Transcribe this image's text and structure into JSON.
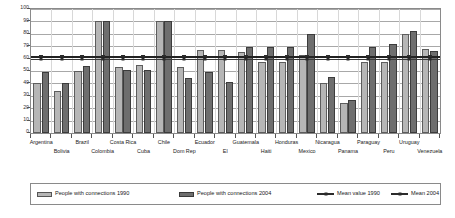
{
  "chart_data": {
    "type": "bar",
    "title": "",
    "xlabel": "",
    "ylabel": "",
    "ylim": [
      0,
      100
    ],
    "ytick_labels": [
      "100",
      "90",
      "80",
      "70",
      "60",
      "50",
      "40",
      "30",
      "20",
      "10",
      "0"
    ],
    "ytick_values": [
      100,
      90,
      80,
      70,
      60,
      50,
      40,
      30,
      20,
      10,
      0
    ],
    "grid": true,
    "legend_position": "bottom",
    "categories": [
      "Argentina",
      "Bolivia",
      "Brazil",
      "Colombia",
      "Costa Rica",
      "Cuba",
      "Chile",
      "Dom Rep",
      "Ecuador",
      "El",
      "Guatemala",
      "Haiti",
      "Honduras",
      "Mexico",
      "Nicaragua",
      "Panama",
      "Paraguay",
      "Peru",
      "Uruguay",
      "Venezuela"
    ],
    "series": [
      {
        "name": "People with connections 1990",
        "color": "#b6b6b6",
        "values": [
          40,
          34,
          50,
          90,
          53,
          55,
          90,
          53,
          67,
          67,
          65,
          57,
          57,
          63,
          40,
          24,
          57,
          57,
          80,
          68
        ]
      },
      {
        "name": "People with connections 2004",
        "color": "#6e6e6e",
        "values": [
          49,
          40,
          54,
          90,
          51,
          51,
          90,
          44,
          49,
          41,
          69,
          69,
          69,
          80,
          45,
          27,
          69,
          72,
          82,
          66
        ]
      }
    ],
    "reference_lines": [
      {
        "name": "Mean value 1990",
        "value": 60,
        "style": "line-square-marker",
        "color": "#2b2b2b"
      },
      {
        "name": "Mean 2004",
        "value": 62,
        "style": "thick-line-dash-marker",
        "color": "#222222"
      }
    ]
  },
  "legend": {
    "items": [
      {
        "label": "People with connections 1990",
        "kind": "swatch-1990"
      },
      {
        "label": "People with connections 2004",
        "kind": "swatch-2004"
      },
      {
        "label": "Mean value 1990",
        "kind": "line-1990"
      },
      {
        "label": "Mean 2004",
        "kind": "line-2004"
      }
    ]
  }
}
